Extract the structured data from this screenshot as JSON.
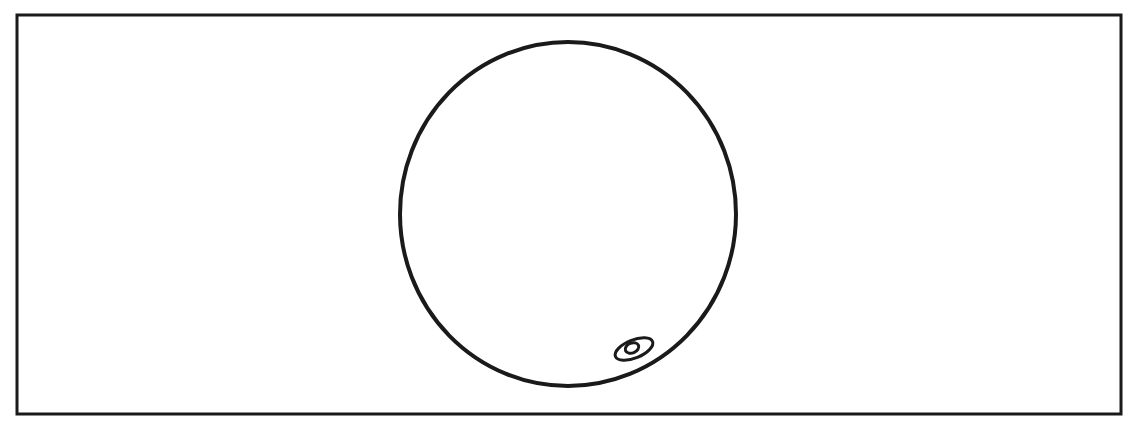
{
  "diagram": {
    "type": "line-drawing",
    "background": "#ffffff",
    "stroke_color": "#1a1a1a",
    "frame": {
      "x": 17,
      "y": 15,
      "width": 1104,
      "height": 399,
      "stroke_width": 3
    },
    "shapes": [
      {
        "name": "large-circle",
        "kind": "ellipse",
        "cx": 568,
        "cy": 214,
        "rx": 168,
        "ry": 172,
        "rotate": 0,
        "stroke_width": 4
      },
      {
        "name": "small-ellipse",
        "kind": "ellipse",
        "cx": 634,
        "cy": 349,
        "rx": 20,
        "ry": 9,
        "rotate": -22,
        "stroke_width": 3
      },
      {
        "name": "inner-blob",
        "kind": "ellipse",
        "cx": 632,
        "cy": 348,
        "rx": 7,
        "ry": 5,
        "rotate": -22,
        "stroke_width": 3
      }
    ]
  }
}
